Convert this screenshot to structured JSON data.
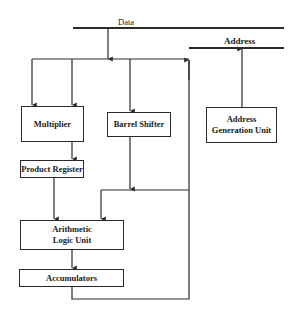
{
  "diagram": {
    "bus_labels": {
      "data": "Data",
      "address": "Address"
    },
    "blocks": {
      "multiplier": "Multiplier",
      "barrel_shifter": "Barrel Shifter",
      "address_generation_unit_line1": "Address",
      "address_generation_unit_line2": "Generation Unit",
      "product_register": "Product Register",
      "alu_line1": "Arithmetic",
      "alu_line2": "Logic Unit",
      "accumulators": "Accumulators"
    },
    "colors": {
      "line": "#2a2a2a",
      "background": "#ffffff"
    }
  }
}
